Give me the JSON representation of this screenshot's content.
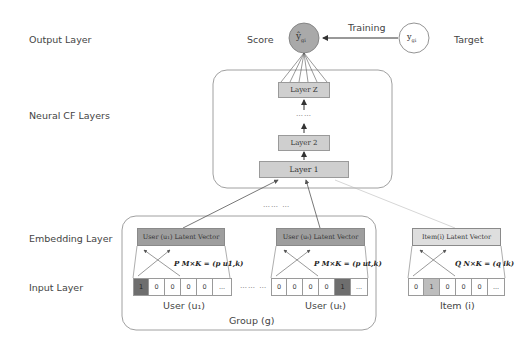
{
  "layer_labels": {
    "output": "Output Layer",
    "neural_cf": "Neural CF Layers",
    "embedding": "Embedding Layer",
    "input": "Input Layer"
  },
  "output": {
    "score_label": "Score",
    "score_symbol": "ŷ",
    "score_subscript": "gi",
    "training_label": "Training",
    "target_symbol": "y",
    "target_subscript": "gi",
    "target_label": "Target"
  },
  "ncf_layers": {
    "layer_z": "Layer Z",
    "ellipsis": "……",
    "layer_2": "Layer 2",
    "layer_1": "Layer 1"
  },
  "between_users_top": "…… …",
  "group": {
    "label": "Group (g)",
    "ellipsis": "…… …",
    "users": [
      {
        "latent_label": "User (u₁) Latent Vector",
        "formula": "P_{M×K} = (p_{u₁,k})",
        "formula_display": "P M×K = (p u1,k)",
        "cells": [
          "1",
          "0",
          "0",
          "0",
          "0",
          "..."
        ],
        "hot_index": 0,
        "label": "User (u₁)"
      },
      {
        "latent_label": "User (uₜ) Latent Vector",
        "formula_display": "P M×K = (p ut,k)",
        "cells": [
          "0",
          "0",
          "0",
          "0",
          "1",
          "..."
        ],
        "hot_index": 4,
        "label": "User (uₜ)"
      }
    ]
  },
  "item": {
    "latent_label": "Item(i) Latent Vector",
    "formula_display": "Q N×K = (q ik)",
    "cells": [
      "0",
      "1",
      "0",
      "0",
      "0",
      "..."
    ],
    "hot_index": 1,
    "label": "Item (i)"
  }
}
